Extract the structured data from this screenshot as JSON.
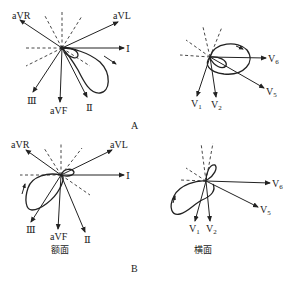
{
  "panels": {
    "A": {
      "label": "A",
      "frontal": {
        "leads": {
          "aVR": "aVR",
          "aVL": "aVL",
          "I": "Ⅰ",
          "III": "Ⅲ",
          "aVF": "aVF",
          "II": "Ⅱ"
        }
      },
      "horizontal": {
        "leads": {
          "V6": "V",
          "V6_sub": "6",
          "V5": "V",
          "V5_sub": "5",
          "V1": "V",
          "V1_sub": "1",
          "V2": "V",
          "V2_sub": "2"
        }
      }
    },
    "B": {
      "label": "B",
      "frontal": {
        "caption": "额面",
        "leads": {
          "aVR": "aVR",
          "aVL": "aVL",
          "I": "Ⅰ",
          "III": "Ⅲ",
          "aVF": "aVF",
          "II": "Ⅱ"
        }
      },
      "horizontal": {
        "caption": "横面",
        "leads": {
          "V6": "V",
          "V6_sub": "6",
          "V5": "V",
          "V5_sub": "5",
          "V1": "V",
          "V1_sub": "1",
          "V2": "V",
          "V2_sub": "2"
        }
      }
    }
  }
}
